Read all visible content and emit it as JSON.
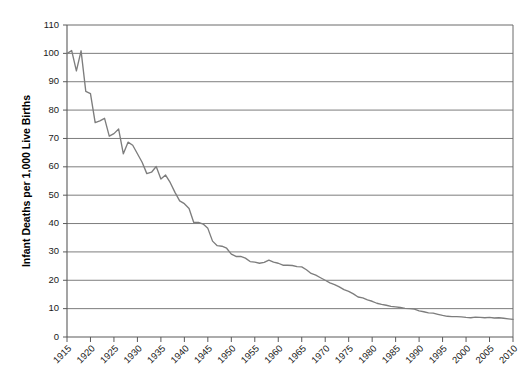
{
  "chart_data": {
    "type": "line",
    "title": "",
    "xlabel": "",
    "ylabel": "Infant Deaths per 1,000 Live Births",
    "ylim": [
      0,
      110
    ],
    "xlim": [
      1915,
      2010
    ],
    "ytick_step": 10,
    "xtick_step": 5,
    "grid": "horizontal",
    "legend": "none",
    "line_color": "#7d7d7d",
    "background_color": "#ffffff",
    "ytick_labels": [
      "0",
      "10",
      "20",
      "30",
      "40",
      "50",
      "60",
      "70",
      "80",
      "90",
      "100",
      "110"
    ],
    "ytick_values": [
      0,
      10,
      20,
      30,
      40,
      50,
      60,
      70,
      80,
      90,
      100,
      110
    ],
    "xtick_labels": [
      "1915",
      "1920",
      "1925",
      "1930",
      "1935",
      "1940",
      "1945",
      "1950",
      "1955",
      "1960",
      "1965",
      "1970",
      "1975",
      "1980",
      "1985",
      "1990",
      "1995",
      "2000",
      "2005",
      "2010"
    ],
    "xtick_values": [
      1915,
      1920,
      1925,
      1930,
      1935,
      1940,
      1945,
      1950,
      1955,
      1960,
      1965,
      1970,
      1975,
      1980,
      1985,
      1990,
      1995,
      2000,
      2005,
      2010
    ],
    "series": [
      {
        "name": "Infant mortality rate",
        "x": [
          1915,
          1916,
          1917,
          1918,
          1919,
          1920,
          1921,
          1922,
          1923,
          1924,
          1925,
          1926,
          1927,
          1928,
          1929,
          1930,
          1931,
          1932,
          1933,
          1934,
          1935,
          1936,
          1937,
          1938,
          1939,
          1940,
          1941,
          1942,
          1943,
          1944,
          1945,
          1946,
          1947,
          1948,
          1949,
          1950,
          1951,
          1952,
          1953,
          1954,
          1955,
          1956,
          1957,
          1958,
          1959,
          1960,
          1961,
          1962,
          1963,
          1964,
          1965,
          1966,
          1967,
          1968,
          1969,
          1970,
          1971,
          1972,
          1973,
          1974,
          1975,
          1976,
          1977,
          1978,
          1979,
          1980,
          1981,
          1982,
          1983,
          1984,
          1985,
          1986,
          1987,
          1988,
          1989,
          1990,
          1991,
          1992,
          1993,
          1994,
          1995,
          1996,
          1997,
          1998,
          1999,
          2000,
          2001,
          2002,
          2003,
          2004,
          2005,
          2006,
          2007,
          2008,
          2009,
          2010
        ],
        "values": [
          99.9,
          101.0,
          93.8,
          100.9,
          86.6,
          85.8,
          75.6,
          76.2,
          77.1,
          70.8,
          71.7,
          73.3,
          64.6,
          68.7,
          67.6,
          64.6,
          61.6,
          57.6,
          58.1,
          60.1,
          55.7,
          57.1,
          54.4,
          51.0,
          48.0,
          47.0,
          45.3,
          40.4,
          40.4,
          39.8,
          38.3,
          33.8,
          32.2,
          32.0,
          31.3,
          29.2,
          28.4,
          28.4,
          27.8,
          26.6,
          26.4,
          26.0,
          26.3,
          27.1,
          26.4,
          26.0,
          25.3,
          25.3,
          25.2,
          24.8,
          24.7,
          23.7,
          22.4,
          21.8,
          20.9,
          20.0,
          19.1,
          18.5,
          17.7,
          16.7,
          16.1,
          15.2,
          14.1,
          13.8,
          13.1,
          12.6,
          11.9,
          11.5,
          11.2,
          10.8,
          10.6,
          10.4,
          10.1,
          10.0,
          9.8,
          9.2,
          8.9,
          8.5,
          8.4,
          8.0,
          7.6,
          7.3,
          7.2,
          7.2,
          7.1,
          6.9,
          6.8,
          7.0,
          6.9,
          6.8,
          6.9,
          6.7,
          6.8,
          6.6,
          6.4,
          6.2
        ]
      }
    ]
  },
  "axis": {
    "y_title": "Infant Deaths per 1,000 Live Births"
  }
}
